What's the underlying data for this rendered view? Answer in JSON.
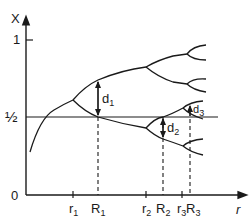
{
  "diagram": {
    "type": "bifurcation-diagram",
    "axes": {
      "y_label": "X",
      "x_label": "r",
      "y_ticks": [
        {
          "label": "1",
          "value": 1
        },
        {
          "label": "½",
          "value": 0.5
        },
        {
          "label": "0",
          "value": 0
        }
      ],
      "x_ticks": [
        {
          "label": "r",
          "sub": "1"
        },
        {
          "label": "R",
          "sub": "1"
        },
        {
          "label": "r",
          "sub": "2"
        },
        {
          "label": "R",
          "sub": "2"
        },
        {
          "label": "r",
          "sub": "3"
        },
        {
          "label": "R",
          "sub": "3"
        }
      ]
    },
    "annotations": [
      {
        "label": "d",
        "sub": "1"
      },
      {
        "label": "d",
        "sub": "2"
      },
      {
        "label": "d",
        "sub": "3"
      }
    ],
    "colors": {
      "line": "#1a1a1a",
      "background": "#ffffff"
    }
  }
}
